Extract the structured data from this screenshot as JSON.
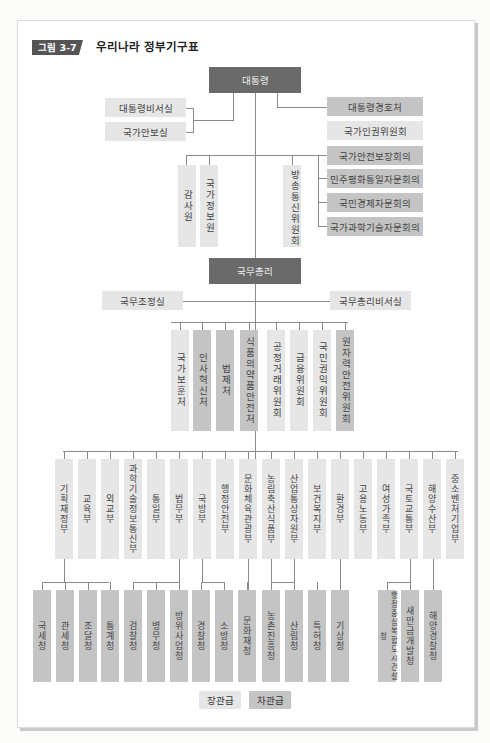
{
  "figure": {
    "tag": "그림 3-7",
    "title": "우리나라 정부기구표"
  },
  "colors": {
    "head": "#6a6a6a",
    "vice_minister_level": "#c4c4c4",
    "minister_level": "#e6e6e6"
  },
  "president": {
    "label": "대통령"
  },
  "president_left": [
    "대통령비서실",
    "국가안보실"
  ],
  "president_right": [
    {
      "label": "대통령경호처",
      "level": "mid"
    },
    {
      "label": "국가인권위원회",
      "level": "light"
    },
    {
      "label": "국가안전보장회의",
      "level": "mid"
    },
    {
      "label": "민주평화통일자문회의",
      "level": "mid"
    },
    {
      "label": "국민경제자문회의",
      "level": "mid"
    },
    {
      "label": "국가과학기술자문회의",
      "level": "mid"
    }
  ],
  "president_vertical": [
    "감사원",
    "국가정보원",
    "방송통신위원회"
  ],
  "prime_minister": {
    "label": "국무총리"
  },
  "pm_side": [
    "국무조정실",
    "국무총리비서실"
  ],
  "pm_units": [
    {
      "label": "국가보훈처",
      "level": "light"
    },
    {
      "label": "인사혁신처",
      "level": "mid"
    },
    {
      "label": "법제처",
      "level": "mid"
    },
    {
      "label": "식품의약품안전처",
      "level": "mid"
    },
    {
      "label": "공정거래위원회",
      "level": "light"
    },
    {
      "label": "금융위원회",
      "level": "light"
    },
    {
      "label": "국민권익위원회",
      "level": "light"
    },
    {
      "label": "원자력안전위원회",
      "level": "mid"
    }
  ],
  "ministries": [
    "기획재정부",
    "교육부",
    "외교부",
    "과학기술정보통신부",
    "통일부",
    "법무부",
    "국방부",
    "행정안전부",
    "문화체육관광부",
    "농림축산식품부",
    "산업통상자원부",
    "보건복지부",
    "환경부",
    "고용노동부",
    "여성가족부",
    "국토교통부",
    "해양수산부",
    "중소벤처기업부"
  ],
  "agencies": [
    "국세청",
    "관세청",
    "조달청",
    "통계청",
    "검찰청",
    "병무청",
    "방위사업청",
    "경찰청",
    "소방청",
    "문화재청",
    "농촌진흥청",
    "산림청",
    "특허청",
    "기상청",
    "행정중심복합도시건설청",
    "새만금개발청",
    "해양경찰청"
  ],
  "legend": {
    "minister_level": "장관급",
    "vice_minister_level": "차관급"
  }
}
